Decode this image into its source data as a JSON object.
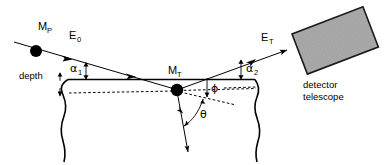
{
  "figure": {
    "background_color": "#ffffff",
    "line_color": "#000000",
    "detector_fill_color": "#a8a8a8",
    "detector_edge_color": "#1a1a1a"
  },
  "labels": {
    "projectile_mass": "M",
    "projectile_mass_sub": "P",
    "incident_energy": "E",
    "incident_energy_sub": "0",
    "target_mass": "M",
    "target_mass_sub": "T",
    "exit_energy": "E",
    "exit_energy_sub": "T",
    "alpha1": "α",
    "alpha1_sub": "1",
    "alpha2": "α",
    "alpha2_sub": "2",
    "phi": "ϕ",
    "theta": "θ",
    "depth": "depth",
    "detector_line1": "detector",
    "detector_line2": "telescope"
  },
  "geometry": {
    "surface_y": 79,
    "surface_x_start": 68,
    "surface_x_end": 255,
    "dashed_depth_y": 93,
    "target_atom_x": 177,
    "target_atom_y": 90,
    "projectile_dot_x": 36,
    "projectile_dot_y": 51,
    "incoming_ray": "from (14,42) to (177,90)",
    "outgoing_ray": "from (177,90) to (285,51)",
    "recoil_ray": "from (177,90) down to (188,155)",
    "detector_rotation_deg": -21
  },
  "angles": {
    "alpha1_description": "angle between incoming beam and surface plane",
    "alpha2_description": "angle between outgoing beam and surface plane",
    "phi_description": "angle between outgoing path and horizontal depth plane",
    "theta_description": "scattering angle between recoil direction and outgoing direction"
  }
}
